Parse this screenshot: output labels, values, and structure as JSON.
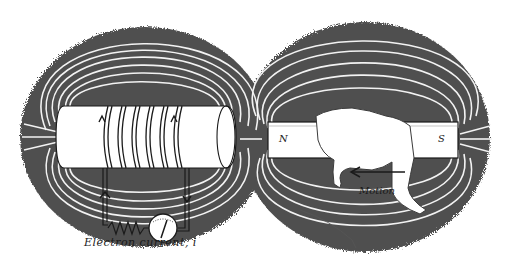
{
  "diagram": {
    "colors": {
      "background": "#ffffff",
      "field_shading": "#4a4a4a",
      "field_lines": "#f2f2f2",
      "ink": "#1a1a1a",
      "object_fill": "#ffffff"
    },
    "labels": {
      "caption": "Electron current, i",
      "motion": "Motion",
      "north_pole": "N",
      "south_pole": "S"
    },
    "components": [
      {
        "name": "coil-cylinder",
        "description": "white cylinder wrapped with 5 wire turns, current arrows pointing up"
      },
      {
        "name": "circuit-wires",
        "description": "two vertical leads from coil down to resistor and meter; left arrow up, right arrow down"
      },
      {
        "name": "resistor",
        "description": "zigzag resistor at bottom-left of circuit"
      },
      {
        "name": "galvanometer",
        "description": "round meter with scale and deflected needle"
      },
      {
        "name": "bar-magnet",
        "description": "rectangular bar magnet held by a hand, N on left, S on right"
      },
      {
        "name": "hand",
        "description": "hand gripping the bar magnet"
      },
      {
        "name": "motion-arrow",
        "description": "arrow pointing left beneath the magnet indicating motion toward coil"
      },
      {
        "name": "magnetic-field",
        "description": "dark shaded field region with white field lines looping around coil and magnet"
      }
    ]
  }
}
